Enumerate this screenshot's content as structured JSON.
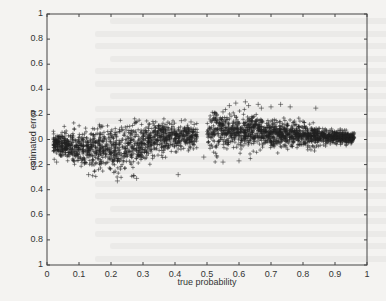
{
  "chart_data": {
    "type": "scatter",
    "title": "",
    "xlabel": "true probability",
    "ylabel": "estimated error",
    "xlim": [
      0,
      1
    ],
    "ylim": [
      -1,
      1
    ],
    "grid": false,
    "legend": null,
    "marker": "+",
    "marker_color": "#222222",
    "x_ticks": [
      0,
      0.1,
      0.2,
      0.3,
      0.4,
      0.5,
      0.6,
      0.7,
      0.8,
      0.9,
      1
    ],
    "x_tick_labels": [
      "0",
      "0.1",
      "0.2",
      "0.3",
      "0.4",
      "0.5",
      "0.6",
      "0.7",
      "0.8",
      "0.9",
      "1"
    ],
    "y_ticks": [
      1,
      0.8,
      0.6,
      0.4,
      0.2,
      0,
      -0.2,
      -0.4,
      -0.6,
      -0.8,
      -1
    ],
    "y_tick_labels": [
      "1",
      "0.8",
      "0.6",
      "0.4",
      "0.2",
      "0",
      "0.2",
      "0.4",
      "0.6",
      "0.8",
      "1"
    ],
    "clusters": [
      {
        "name": "left cluster",
        "x_range": [
          0.02,
          0.47
        ],
        "center_at_start": -0.03,
        "center_at_end": 0.03,
        "mid_dip": -0.08,
        "spread": 0.07,
        "count": 1300
      },
      {
        "name": "right cluster",
        "x_range": [
          0.5,
          0.96
        ],
        "center_at_start": 0.08,
        "center_at_end": 0.01,
        "spread_at_start": 0.08,
        "spread_at_end": 0.02,
        "count": 1500
      }
    ],
    "outliers": [
      [
        0.03,
        -0.18
      ],
      [
        0.13,
        -0.28
      ],
      [
        0.22,
        -0.33
      ],
      [
        0.27,
        -0.29
      ],
      [
        0.28,
        -0.31
      ],
      [
        0.41,
        -0.28
      ],
      [
        0.36,
        0.1
      ],
      [
        0.39,
        0.12
      ],
      [
        0.42,
        0.15
      ],
      [
        0.45,
        0.14
      ],
      [
        0.46,
        0.12
      ],
      [
        0.49,
        -0.14
      ],
      [
        0.53,
        -0.13
      ],
      [
        0.55,
        -0.18
      ],
      [
        0.6,
        -0.17
      ],
      [
        0.57,
        0.27
      ],
      [
        0.59,
        0.29
      ],
      [
        0.62,
        0.3
      ],
      [
        0.63,
        0.27
      ],
      [
        0.66,
        0.28
      ],
      [
        0.67,
        0.25
      ],
      [
        0.7,
        0.26
      ],
      [
        0.73,
        0.28
      ],
      [
        0.76,
        0.26
      ],
      [
        0.84,
        0.25
      ],
      [
        0.53,
        0.2
      ],
      [
        0.55,
        0.22
      ]
    ]
  },
  "page": {
    "background": "#f4f3f1"
  }
}
